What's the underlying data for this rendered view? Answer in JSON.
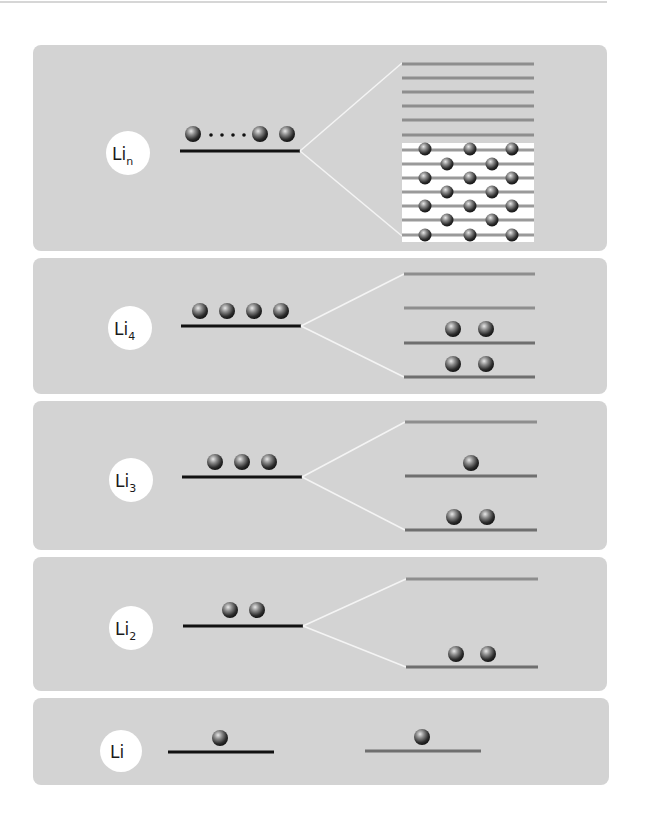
{
  "colors": {
    "page_bg": "#ffffff",
    "top_rule": "#c8c8c8",
    "panel_bg": "#d3d3d3",
    "level_line_dark": "#111111",
    "level_line_gray": "#6f6f6f",
    "level_line_light": "#8e8e8e",
    "fan_line": "#f4f4f4",
    "label_circle": "#ffffff",
    "band_fill": "#ffffff"
  },
  "panels": [
    {
      "id": "lin",
      "label": "Li",
      "subscript": "n",
      "bounds": {
        "x": 33,
        "y": 45,
        "w": 574,
        "h": 206
      },
      "left_level": {
        "x1": 180,
        "x2": 300,
        "y": 151,
        "balls_x": [
          193,
          260,
          287
        ],
        "ellipsis_dots_x": [
          211,
          222,
          233,
          244
        ]
      },
      "right_levels": {
        "x1": 402,
        "x2": 534,
        "empty_y": [
          64,
          78,
          92,
          106,
          120,
          135
        ],
        "filled_band": {
          "y_top": 143,
          "y_bottom": 242
        },
        "filled_y": [
          150,
          164,
          178,
          192,
          206,
          220,
          235
        ],
        "balls_odd_x": [
          425,
          470,
          512
        ],
        "balls_even_x": [
          447,
          492
        ]
      }
    },
    {
      "id": "li4",
      "label": "Li",
      "subscript": "4",
      "bounds": {
        "x": 33,
        "y": 258,
        "w": 574,
        "h": 136
      },
      "left_level": {
        "x1": 181,
        "x2": 301,
        "y": 326,
        "balls_x": [
          200,
          227,
          254,
          281
        ]
      },
      "right_levels": {
        "x1": 404,
        "x2": 535,
        "levels": [
          {
            "y": 274,
            "tone": "light",
            "balls_x": []
          },
          {
            "y": 308,
            "tone": "light",
            "balls_x": []
          },
          {
            "y": 343,
            "tone": "gray",
            "balls_x": [
              453,
              486
            ]
          },
          {
            "y": 377,
            "tone": "gray",
            "balls_x": [
              453,
              486
            ]
          }
        ]
      }
    },
    {
      "id": "li3",
      "label": "Li",
      "subscript": "3",
      "bounds": {
        "x": 33,
        "y": 401,
        "w": 574,
        "h": 149
      },
      "left_level": {
        "x1": 182,
        "x2": 302,
        "y": 477,
        "balls_x": [
          215,
          242,
          269
        ]
      },
      "right_levels": {
        "x1": 405,
        "x2": 537,
        "levels": [
          {
            "y": 422,
            "tone": "light",
            "balls_x": []
          },
          {
            "y": 476,
            "tone": "gray",
            "balls_x": [
              471
            ]
          },
          {
            "y": 530,
            "tone": "gray",
            "balls_x": [
              454,
              487
            ]
          }
        ]
      }
    },
    {
      "id": "li2",
      "label": "Li",
      "subscript": "2",
      "bounds": {
        "x": 33,
        "y": 557,
        "w": 574,
        "h": 134
      },
      "left_level": {
        "x1": 183,
        "x2": 303,
        "y": 626,
        "balls_x": [
          230,
          257
        ]
      },
      "right_levels": {
        "x1": 406,
        "x2": 538,
        "levels": [
          {
            "y": 579,
            "tone": "light",
            "balls_x": []
          },
          {
            "y": 667,
            "tone": "gray",
            "balls_x": [
              456,
              488
            ]
          }
        ]
      }
    },
    {
      "id": "li1",
      "label": "Li",
      "subscript": "",
      "bounds": {
        "x": 33,
        "y": 698,
        "w": 576,
        "h": 87
      },
      "left_level": {
        "x1": 183,
        "x2": 304,
        "y": 752,
        "balls_x": [
          219
        ]
      },
      "right_levels": {
        "x1": 365,
        "x2": 481,
        "levels": [
          {
            "y": 751,
            "tone": "gray",
            "balls_x": [
              422
            ]
          }
        ]
      }
    }
  ],
  "labels": {
    "lin": {
      "main": "Li",
      "sub": "n"
    },
    "li4": {
      "main": "Li",
      "sub": "4"
    },
    "li3": {
      "main": "Li",
      "sub": "3"
    },
    "li2": {
      "main": "Li",
      "sub": "2"
    },
    "li1": {
      "main": "Li",
      "sub": ""
    }
  }
}
